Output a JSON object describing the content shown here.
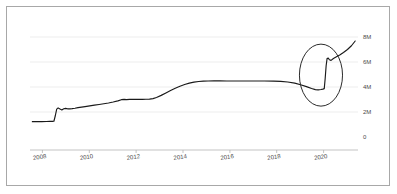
{
  "chart_data": {
    "type": "line",
    "title": "",
    "subtitle": "",
    "xlabel": "",
    "ylabel": "",
    "xlim": [
      2007.6,
      2021.6
    ],
    "ylim": [
      0,
      8600000
    ],
    "grid": true,
    "legend": null,
    "y_ticks": [
      0,
      2000000,
      4000000,
      6000000,
      8000000
    ],
    "y_tick_labels": [
      "0",
      "2M",
      "4M",
      "6M",
      "8M"
    ],
    "y_tick_label_position": "right",
    "x_ticks": [
      2008,
      2010,
      2012,
      2014,
      2016,
      2018,
      2020
    ],
    "x_tick_labels": [
      "2008",
      "2010",
      "2012",
      "2014",
      "2016",
      "2018",
      "2020"
    ],
    "series": [
      {
        "name": "value",
        "color": "#1a1a1a",
        "x": [
          2007.7,
          2007.9,
          2008.1,
          2008.3,
          2008.45,
          2008.55,
          2008.62,
          2008.68,
          2008.74,
          2008.8,
          2008.88,
          2008.96,
          2009.04,
          2009.12,
          2009.2,
          2009.3,
          2009.4,
          2009.52,
          2009.65,
          2009.8,
          2009.95,
          2010.15,
          2010.35,
          2010.55,
          2010.75,
          2010.95,
          2011.15,
          2011.35,
          2011.5,
          2011.62,
          2011.72,
          2011.85,
          2012.0,
          2012.2,
          2012.4,
          2012.55,
          2012.7,
          2012.85,
          2013.0,
          2013.2,
          2013.4,
          2013.6,
          2013.8,
          2014.0,
          2014.2,
          2014.4,
          2014.6,
          2014.8,
          2015.0,
          2015.2,
          2015.45,
          2015.7,
          2016.0,
          2016.4,
          2016.8,
          2017.2,
          2017.6,
          2018.0,
          2018.3,
          2018.6,
          2018.9,
          2019.15,
          2019.4,
          2019.62,
          2019.78,
          2019.9,
          2020.02,
          2020.1,
          2020.16,
          2020.2,
          2020.24,
          2020.28,
          2020.33,
          2020.38,
          2020.45,
          2020.55,
          2020.68,
          2020.82,
          2020.98,
          2021.15,
          2021.32,
          2021.48
        ],
        "y": [
          1230000,
          1230000,
          1235000,
          1240000,
          1245000,
          1250000,
          1260000,
          1700000,
          2230000,
          2330000,
          2240000,
          2165000,
          2255000,
          2290000,
          2255000,
          2250000,
          2270000,
          2300000,
          2345000,
          2390000,
          2430000,
          2490000,
          2545000,
          2600000,
          2660000,
          2720000,
          2800000,
          2890000,
          2985000,
          3010000,
          2995000,
          3010000,
          3015000,
          3015000,
          3010000,
          3020000,
          3035000,
          3070000,
          3165000,
          3330000,
          3520000,
          3720000,
          3900000,
          4060000,
          4200000,
          4310000,
          4390000,
          4440000,
          4470000,
          4480000,
          4485000,
          4485000,
          4480000,
          4478000,
          4477000,
          4478000,
          4477000,
          4470000,
          4450000,
          4400000,
          4310000,
          4180000,
          4030000,
          3880000,
          3790000,
          3765000,
          3800000,
          3830000,
          3870000,
          4700000,
          5700000,
          6270000,
          6310000,
          6180000,
          6130000,
          6280000,
          6420000,
          6560000,
          6760000,
          7000000,
          7300000,
          7680000
        ]
      }
    ],
    "annotations": [
      {
        "type": "ellipse",
        "name": "highlight-circle",
        "cx": 2020.02,
        "cy": 4950000,
        "rx": 0.92,
        "ry": 2480000,
        "color": "#2b2b2b"
      }
    ]
  }
}
